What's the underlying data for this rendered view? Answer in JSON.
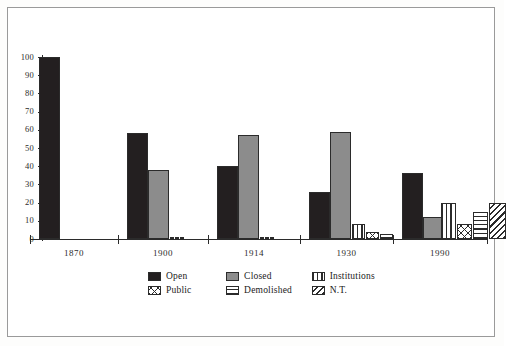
{
  "chart_data": {
    "type": "bar",
    "title": "",
    "subtitle": "",
    "xlabel": "",
    "ylabel": "",
    "categories": [
      "1870",
      "1900",
      "1914",
      "1930",
      "1990"
    ],
    "ylim": [
      0,
      100
    ],
    "yticks": [
      0,
      10,
      20,
      30,
      40,
      50,
      60,
      70,
      80,
      90,
      100
    ],
    "ytick_labels": [
      "0",
      "10",
      "20",
      "30",
      "40",
      "50",
      "60",
      "70",
      "80",
      "90",
      "100"
    ],
    "grid": false,
    "legend_position": "bottom-center",
    "series": [
      {
        "name": "Open",
        "pattern": "solid-black",
        "color": "#231f20",
        "values": [
          100,
          58,
          40,
          26,
          36
        ]
      },
      {
        "name": "Closed",
        "pattern": "solid-gray",
        "color": "#8c8c8c",
        "values": [
          0,
          38,
          57,
          59,
          12
        ]
      },
      {
        "name": "Institutions",
        "pattern": "vertical-stripes",
        "color": "#2b2b2b",
        "values": [
          0,
          1,
          1,
          8,
          20
        ]
      },
      {
        "name": "Public",
        "pattern": "cross-hatch",
        "color": "#2b2b2b",
        "values": [
          0,
          1,
          1,
          4,
          8
        ]
      },
      {
        "name": "Demolished",
        "pattern": "horizontal-stripes",
        "color": "#2b2b2b",
        "values": [
          0,
          1,
          1,
          3,
          15
        ]
      },
      {
        "name": "N.T.",
        "pattern": "diagonal-stripes",
        "color": "#2b2b2b",
        "values": [
          0,
          0,
          0,
          0,
          20
        ]
      }
    ]
  },
  "legend": {
    "rows": [
      [
        {
          "label": "Open",
          "pattern": "fill-open",
          "icon": "legend-swatch-open"
        },
        {
          "label": "Closed",
          "pattern": "fill-closed",
          "icon": "legend-swatch-closed"
        },
        {
          "label": "Institutions",
          "pattern": "fill-inst",
          "icon": "legend-swatch-institutions"
        }
      ],
      [
        {
          "label": "Public",
          "pattern": "fill-public",
          "icon": "legend-swatch-public"
        },
        {
          "label": "Demolished",
          "pattern": "fill-demol",
          "icon": "legend-swatch-demolished"
        },
        {
          "label": "N.T.",
          "pattern": "fill-nt",
          "icon": "legend-swatch-nt"
        }
      ]
    ]
  },
  "colors": {
    "open": "#231f20",
    "closed": "#8c8c8c",
    "axis": "#2b2b2b",
    "frame": "#9a9a9a",
    "background": "#ffffff"
  }
}
